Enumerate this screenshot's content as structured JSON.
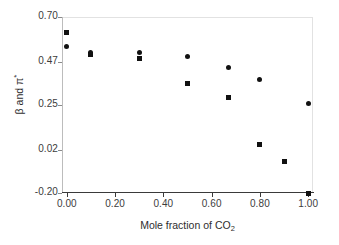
{
  "chart_data": {
    "type": "scatter",
    "title": "",
    "xlabel": "Mole fraction of CO2",
    "ylabel": "beta and pi*",
    "xlim": [
      -0.02,
      1.02
    ],
    "ylim": [
      -0.2,
      0.7
    ],
    "grid": false,
    "legend_position": "none",
    "xticks": [
      "0.00",
      "0.20",
      "0.40",
      "0.60",
      "0.80",
      "1.00"
    ],
    "xtick_values": [
      0.0,
      0.2,
      0.4,
      0.6,
      0.8,
      1.0
    ],
    "yticks": [
      "0.70",
      "0.47",
      "0.25",
      "0.02",
      "-0.20"
    ],
    "ytick_values": [
      0.7,
      0.47,
      0.25,
      0.02,
      -0.2
    ],
    "series": [
      {
        "name": "pi*",
        "marker": "circle",
        "color": "#111111",
        "points": [
          {
            "x": 0.0,
            "y": 0.55
          },
          {
            "x": 0.1,
            "y": 0.52
          },
          {
            "x": 0.3,
            "y": 0.52
          },
          {
            "x": 0.5,
            "y": 0.5
          },
          {
            "x": 0.67,
            "y": 0.44
          },
          {
            "x": 0.8,
            "y": 0.38
          },
          {
            "x": 1.0,
            "y": 0.26
          }
        ]
      },
      {
        "name": "beta",
        "marker": "square",
        "color": "#111111",
        "points": [
          {
            "x": 0.0,
            "y": 0.62
          },
          {
            "x": 0.1,
            "y": 0.51
          },
          {
            "x": 0.3,
            "y": 0.49
          },
          {
            "x": 0.5,
            "y": 0.36
          },
          {
            "x": 0.67,
            "y": 0.29
          },
          {
            "x": 0.8,
            "y": 0.05
          },
          {
            "x": 0.9,
            "y": -0.04
          },
          {
            "x": 1.0,
            "y": -0.2
          }
        ]
      }
    ]
  },
  "axis_titles": {
    "x_prefix": "Mole fraction of CO",
    "x_subscript": "2",
    "y_text": "β and π",
    "y_superscript": "*"
  }
}
